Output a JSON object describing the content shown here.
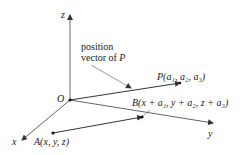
{
  "diagram": {
    "axes": {
      "x_label": "x",
      "y_label": "y",
      "z_label": "z",
      "origin_label": "O"
    },
    "annotation": {
      "line1": "position",
      "line2_prefix": "vector of ",
      "line2_var": "P"
    },
    "points": {
      "P": {
        "name": "P",
        "coords": "(a₁, a₂, a₃)"
      },
      "A": {
        "name": "A",
        "coords": "(x, y, z)"
      },
      "B": {
        "name": "B",
        "coords": "(x + a₁, y + a₂, z + a₃)"
      }
    },
    "colors": {
      "line": "#333333",
      "text": "#222222",
      "background": "#ffffff"
    }
  }
}
